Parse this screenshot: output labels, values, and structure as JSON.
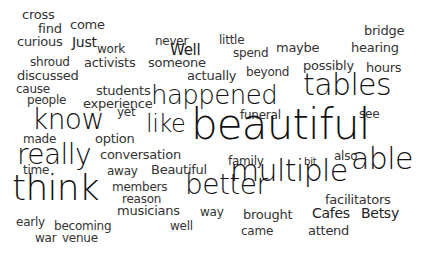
{
  "background": "#ffffff",
  "text_color_large": "#111111",
  "text_color_small": "#333333",
  "words": [
    {
      "text": "cross",
      "x": 22,
      "y": 10,
      "size": 13
    },
    {
      "text": "find",
      "x": 38,
      "y": 24,
      "size": 13
    },
    {
      "text": "come",
      "x": 70,
      "y": 20,
      "size": 13
    },
    {
      "text": "curious",
      "x": 17,
      "y": 37,
      "size": 13
    },
    {
      "text": "Just",
      "x": 72,
      "y": 37,
      "size": 14
    },
    {
      "text": "work",
      "x": 97,
      "y": 45,
      "size": 12
    },
    {
      "text": "shroud",
      "x": 30,
      "y": 58,
      "size": 12
    },
    {
      "text": "activists",
      "x": 84,
      "y": 58,
      "size": 13
    },
    {
      "text": "discussed",
      "x": 17,
      "y": 71,
      "size": 13
    },
    {
      "text": "never",
      "x": 155,
      "y": 37,
      "size": 12
    },
    {
      "text": "Well",
      "x": 170,
      "y": 45,
      "size": 15
    },
    {
      "text": "someone",
      "x": 148,
      "y": 58,
      "size": 13
    },
    {
      "text": "little",
      "x": 219,
      "y": 36,
      "size": 12
    },
    {
      "text": "spend",
      "x": 233,
      "y": 49,
      "size": 12
    },
    {
      "text": "actually",
      "x": 187,
      "y": 71,
      "size": 13
    },
    {
      "text": "beyond",
      "x": 246,
      "y": 68,
      "size": 12
    },
    {
      "text": "maybe",
      "x": 276,
      "y": 43,
      "size": 13
    },
    {
      "text": "bridge",
      "x": 364,
      "y": 26,
      "size": 13
    },
    {
      "text": "hearing",
      "x": 351,
      "y": 43,
      "size": 13
    },
    {
      "text": "possibly",
      "x": 303,
      "y": 61,
      "size": 13
    },
    {
      "text": "hours",
      "x": 366,
      "y": 63,
      "size": 13
    },
    {
      "text": "cause",
      "x": 16,
      "y": 85,
      "size": 12
    },
    {
      "text": "students",
      "x": 96,
      "y": 86,
      "size": 13
    },
    {
      "text": "people",
      "x": 27,
      "y": 96,
      "size": 12
    },
    {
      "text": "experience",
      "x": 83,
      "y": 99,
      "size": 13
    },
    {
      "text": "happened",
      "x": 151,
      "y": 86,
      "size": 26
    },
    {
      "text": "tables",
      "x": 303,
      "y": 74,
      "size": 30
    },
    {
      "text": "see",
      "x": 359,
      "y": 110,
      "size": 12
    },
    {
      "text": "know",
      "x": 32,
      "y": 110,
      "size": 28
    },
    {
      "text": "yet",
      "x": 117,
      "y": 108,
      "size": 12
    },
    {
      "text": "funeral",
      "x": 240,
      "y": 111,
      "size": 12
    },
    {
      "text": "like",
      "x": 146,
      "y": 116,
      "size": 24
    },
    {
      "text": "beautiful",
      "x": 191,
      "y": 110,
      "size": 42
    },
    {
      "text": "made",
      "x": 23,
      "y": 135,
      "size": 12
    },
    {
      "text": "option",
      "x": 95,
      "y": 134,
      "size": 13
    },
    {
      "text": "really",
      "x": 17,
      "y": 145,
      "size": 28
    },
    {
      "text": "conversation",
      "x": 100,
      "y": 150,
      "size": 13
    },
    {
      "text": "time",
      "x": 23,
      "y": 166,
      "size": 12
    },
    {
      "text": "away",
      "x": 107,
      "y": 167,
      "size": 12
    },
    {
      "text": "Beautiful",
      "x": 151,
      "y": 165,
      "size": 13
    },
    {
      "text": "family",
      "x": 228,
      "y": 157,
      "size": 12
    },
    {
      "text": "bit",
      "x": 304,
      "y": 158,
      "size": 10
    },
    {
      "text": "also",
      "x": 334,
      "y": 152,
      "size": 12
    },
    {
      "text": "multiple",
      "x": 230,
      "y": 160,
      "size": 30
    },
    {
      "text": "able",
      "x": 351,
      "y": 148,
      "size": 30
    },
    {
      "text": "members",
      "x": 112,
      "y": 183,
      "size": 12
    },
    {
      "text": "think",
      "x": 12,
      "y": 175,
      "size": 36
    },
    {
      "text": "better",
      "x": 185,
      "y": 175,
      "size": 28
    },
    {
      "text": "facilitators",
      "x": 325,
      "y": 195,
      "size": 13
    },
    {
      "text": "reason",
      "x": 122,
      "y": 195,
      "size": 12
    },
    {
      "text": "musicians",
      "x": 117,
      "y": 206,
      "size": 13
    },
    {
      "text": "way",
      "x": 200,
      "y": 208,
      "size": 12
    },
    {
      "text": "brought",
      "x": 243,
      "y": 210,
      "size": 13
    },
    {
      "text": "Cafes",
      "x": 312,
      "y": 208,
      "size": 14
    },
    {
      "text": "Betsy",
      "x": 361,
      "y": 208,
      "size": 14
    },
    {
      "text": "well",
      "x": 170,
      "y": 222,
      "size": 12
    },
    {
      "text": "early",
      "x": 16,
      "y": 218,
      "size": 12
    },
    {
      "text": "becoming",
      "x": 54,
      "y": 222,
      "size": 12
    },
    {
      "text": "came",
      "x": 241,
      "y": 227,
      "size": 12
    },
    {
      "text": "attend",
      "x": 308,
      "y": 226,
      "size": 13
    },
    {
      "text": "war",
      "x": 35,
      "y": 234,
      "size": 12
    },
    {
      "text": "venue",
      "x": 62,
      "y": 234,
      "size": 12
    }
  ]
}
